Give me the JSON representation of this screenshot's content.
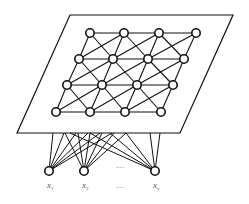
{
  "diagram": {
    "type": "self-organizing-map",
    "plane": {
      "corners": [
        [
          70,
          15
        ],
        [
          233,
          15
        ],
        [
          180,
          133
        ],
        [
          17,
          133
        ]
      ],
      "stroke": "#111111"
    },
    "lattice": {
      "rows": [
        {
          "y": 33,
          "xs": [
            90,
            124,
            159,
            196
          ]
        },
        {
          "y": 59,
          "xs": [
            79,
            113,
            148,
            184
          ]
        },
        {
          "y": 85,
          "xs": [
            67,
            102,
            137,
            173
          ]
        },
        {
          "y": 112,
          "xs": [
            56,
            90,
            125,
            161
          ]
        }
      ],
      "node_radius": 4.2,
      "node_fill": "#ffffff",
      "node_stroke": "#111111"
    },
    "inputs": [
      {
        "id": "x1",
        "label": "x",
        "subscript": "1",
        "x": 49,
        "y": 171,
        "targets": [
          53,
          64,
          76,
          88,
          100,
          112
        ]
      },
      {
        "id": "x2",
        "label": "x",
        "subscript": "2",
        "x": 84,
        "y": 171,
        "targets": [
          65,
          78,
          90,
          102,
          114,
          126
        ]
      },
      {
        "id": "xn",
        "label": "x",
        "subscript": "n",
        "x": 155,
        "y": 171,
        "targets": [
          70,
          90,
          110,
          126,
          150,
          160
        ]
      }
    ],
    "ellipsis_between_inputs": "···",
    "ellipsis_between_labels": "···",
    "edge_y": 133
  }
}
